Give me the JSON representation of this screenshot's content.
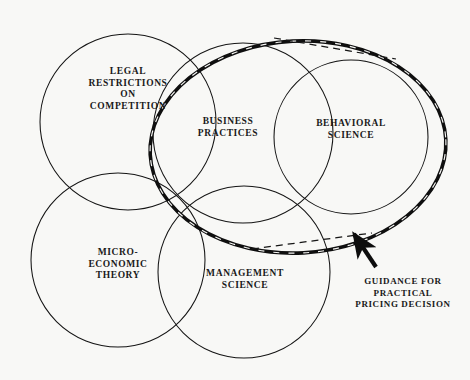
{
  "diagram": {
    "background_color": "#f8f8f6",
    "ink_color": "#111111",
    "sets": [
      {
        "id": "legal-restrictions",
        "label": "LEGAL\nRESTRICTIONS\nON\nCOMPETITION",
        "shape": "circle",
        "style": "thin-solid",
        "cx": 128,
        "cy": 122,
        "r": 88
      },
      {
        "id": "business-practices",
        "label": "BUSINESS\nPRACTICES",
        "shape": "circle",
        "style": "thin-solid",
        "cx": 243,
        "cy": 133,
        "r": 90
      },
      {
        "id": "behavioral-science",
        "label": "BEHAVIORAL\nSCIENCE",
        "shape": "circle",
        "style": "thin-solid",
        "cx": 351,
        "cy": 137,
        "r": 77
      },
      {
        "id": "micro-economic-theory",
        "label": "MICRO-\nECONOMIC\nTHEORY",
        "shape": "circle",
        "style": "thin-solid",
        "cx": 118,
        "cy": 260,
        "r": 87
      },
      {
        "id": "management-science",
        "label": "MANAGEMENT\nSCIENCE",
        "shape": "circle",
        "style": "thin-solid",
        "cx": 244,
        "cy": 272,
        "r": 86
      }
    ],
    "highlight": {
      "id": "guidance-ellipse",
      "style": "thick-dashed-outline",
      "cx": 298,
      "cy": 147,
      "rx": 148,
      "ry": 106,
      "rotation_deg": -3
    },
    "leader_lines": [
      {
        "id": "leader-top",
        "x1": 274,
        "y1": 38,
        "x2": 396,
        "y2": 59
      },
      {
        "id": "leader-bottom",
        "x1": 252,
        "y1": 249,
        "x2": 372,
        "y2": 233
      }
    ],
    "callout": {
      "id": "guidance-callout",
      "label": "GUIDANCE FOR\nPRACTICAL\nPRICING DECISION",
      "arrow": {
        "tail_x": 376,
        "tail_y": 267,
        "tip_x": 351,
        "tip_y": 230
      }
    }
  }
}
